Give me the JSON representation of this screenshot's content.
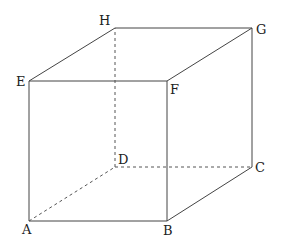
{
  "figure": {
    "type": "cube",
    "vertices": {
      "A": {
        "label": "A",
        "x": 29,
        "y": 221
      },
      "B": {
        "label": "B",
        "x": 167,
        "y": 221
      },
      "C": {
        "label": "C",
        "x": 252,
        "y": 167
      },
      "D": {
        "label": "D",
        "x": 115,
        "y": 167
      },
      "E": {
        "label": "E",
        "x": 29,
        "y": 81
      },
      "F": {
        "label": "F",
        "x": 167,
        "y": 81
      },
      "G": {
        "label": "G",
        "x": 252,
        "y": 28
      },
      "H": {
        "label": "H",
        "x": 115,
        "y": 28
      }
    },
    "visible_edges": [
      "AB",
      "BC",
      "CG",
      "GH",
      "HE",
      "EA",
      "EF",
      "FB",
      "FG"
    ],
    "hidden_edges": [
      "AD",
      "DC",
      "DH"
    ]
  }
}
